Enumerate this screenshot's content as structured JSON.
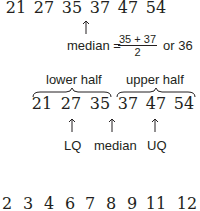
{
  "row1": {
    "values": [
      "21",
      "27",
      "35",
      "37",
      "47",
      "54"
    ]
  },
  "median_calc": {
    "label": "median =",
    "numerator": "35 + 37",
    "denominator": "2",
    "result": "or 36"
  },
  "halves": {
    "lower_label": "lower half",
    "upper_label": "upper half"
  },
  "row2": {
    "values": [
      "21",
      "27",
      "35",
      "37",
      "47",
      "54"
    ]
  },
  "markers": {
    "lq": "LQ",
    "median": "median",
    "uq": "UQ"
  },
  "row3": {
    "values": [
      "2",
      "3",
      "4",
      "6",
      "7",
      "8",
      "9",
      "11",
      "12"
    ]
  }
}
